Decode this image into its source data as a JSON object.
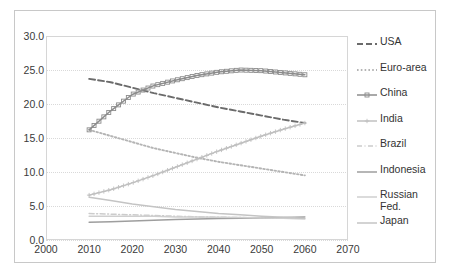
{
  "chart_data": {
    "type": "line",
    "title": "",
    "xlabel": "",
    "ylabel": "",
    "xlim": [
      2000,
      2070
    ],
    "ylim": [
      0,
      30
    ],
    "grid": true,
    "legend_position": "right",
    "x_ticks": [
      "2000",
      "2010",
      "2020",
      "2030",
      "2040",
      "2050",
      "2060",
      "2070"
    ],
    "y_ticks": [
      "0.0",
      "5.0",
      "10.0",
      "15.0",
      "20.0",
      "25.0",
      "30.0"
    ],
    "x": [
      2010,
      2015,
      2020,
      2025,
      2030,
      2035,
      2040,
      2045,
      2050,
      2055,
      2060
    ],
    "series": [
      {
        "name": "USA",
        "style": "dashed",
        "color": "#6b6b6b",
        "values": [
          23.7,
          23.2,
          22.4,
          21.6,
          20.9,
          20.2,
          19.5,
          18.9,
          18.3,
          17.7,
          17.2
        ]
      },
      {
        "name": "Euro-area",
        "style": "dotted",
        "color": "#b4b4b4",
        "values": [
          16.2,
          15.3,
          14.4,
          13.5,
          12.8,
          12.1,
          11.5,
          11.0,
          10.5,
          10.0,
          9.5
        ]
      },
      {
        "name": "China",
        "style": "marker-square",
        "color": "#8c8c8c",
        "values": [
          16.2,
          19.0,
          21.4,
          22.7,
          23.5,
          24.2,
          24.7,
          25.0,
          24.9,
          24.6,
          24.3
        ]
      },
      {
        "name": "India",
        "style": "marker-plus",
        "color": "#c0c0c0",
        "values": [
          6.6,
          7.4,
          8.4,
          9.5,
          10.7,
          11.9,
          13.1,
          14.2,
          15.3,
          16.3,
          17.2
        ]
      },
      {
        "name": "Brazil",
        "style": "dash-dot",
        "color": "#cccccc",
        "values": [
          3.9,
          3.8,
          3.7,
          3.6,
          3.5,
          3.4,
          3.35,
          3.3,
          3.25,
          3.2,
          3.2
        ]
      },
      {
        "name": "Indonesia",
        "style": "solid",
        "color": "#9e9e9e",
        "values": [
          2.6,
          2.7,
          2.8,
          2.9,
          3.0,
          3.1,
          3.15,
          3.2,
          3.25,
          3.3,
          3.4
        ]
      },
      {
        "name": "Russian Fed.",
        "style": "solid-light",
        "color": "#cfcfcf",
        "values": [
          3.5,
          3.5,
          3.5,
          3.5,
          3.4,
          3.4,
          3.35,
          3.3,
          3.25,
          3.2,
          3.1
        ]
      },
      {
        "name": "Japan",
        "style": "solid-light2",
        "color": "#c4c4c4",
        "values": [
          6.3,
          5.8,
          5.3,
          4.9,
          4.5,
          4.2,
          3.9,
          3.7,
          3.5,
          3.35,
          3.2
        ]
      }
    ]
  },
  "legend": {
    "items": [
      {
        "label": "USA"
      },
      {
        "label": "Euro-area"
      },
      {
        "label": "China"
      },
      {
        "label": "India"
      },
      {
        "label": "Brazil"
      },
      {
        "label": "Indonesia"
      },
      {
        "label": "Russian\nFed."
      },
      {
        "label": "Japan"
      }
    ]
  }
}
